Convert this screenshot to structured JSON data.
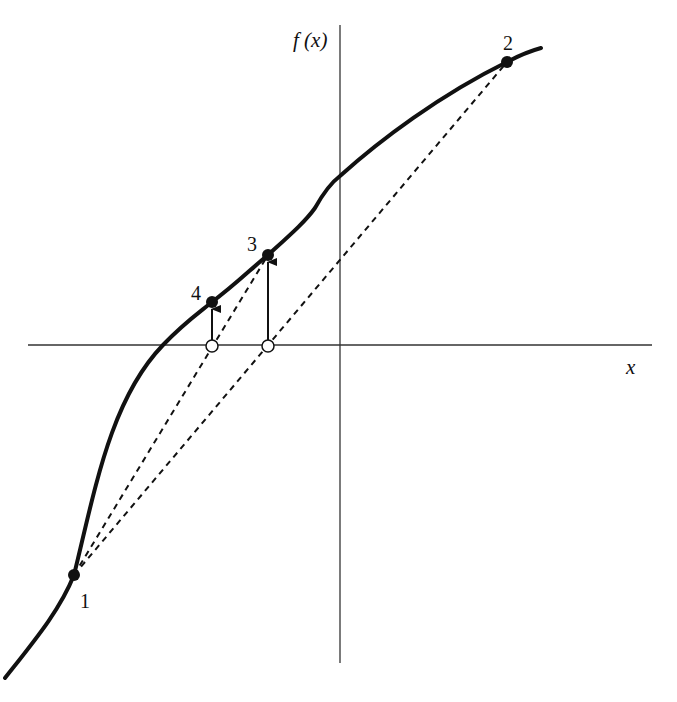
{
  "diagram": {
    "axes": {
      "x_label": "x",
      "y_label": "f (x)",
      "x_axis": {
        "x1": 28,
        "x2": 652,
        "y": 345
      },
      "y_axis": {
        "x": 340,
        "y1": 25,
        "y2": 663
      }
    },
    "curve": {
      "label": "f(x)",
      "path": "M 5 678 C 35 640, 60 610, 74 575 C 95 490, 110 400, 163 345 C 185 322, 200 312, 212 302 C 235 285, 252 268, 268 255 C 290 235, 305 222, 315 208 C 325 190, 332 182, 340 176 C 380 140, 440 95, 507 62 C 520 55, 530 51, 541 48"
    },
    "points": [
      {
        "id": "1",
        "label": "1",
        "x": 74,
        "y": 575,
        "label_x": 80,
        "label_y": 608
      },
      {
        "id": "2",
        "label": "2",
        "x": 507,
        "y": 62,
        "label_x": 503,
        "label_y": 50
      },
      {
        "id": "3",
        "label": "3",
        "x": 268,
        "y": 255,
        "label_x": 247,
        "label_y": 251
      },
      {
        "id": "4",
        "label": "4",
        "x": 212,
        "y": 302,
        "label_x": 191,
        "label_y": 300
      }
    ],
    "secants": [
      {
        "from": "1",
        "to": "2",
        "x1": 74,
        "y1": 575,
        "x2": 507,
        "y2": 62
      },
      {
        "from": "1",
        "to": "3",
        "x1": 74,
        "y1": 575,
        "x2": 268,
        "y2": 255
      }
    ],
    "roots": [
      {
        "x": 212,
        "y": 346
      },
      {
        "x": 268,
        "y": 346
      }
    ],
    "arrows": [
      {
        "x": 212,
        "y1": 341,
        "y2": 309
      },
      {
        "x": 268,
        "y1": 341,
        "y2": 262
      }
    ]
  }
}
